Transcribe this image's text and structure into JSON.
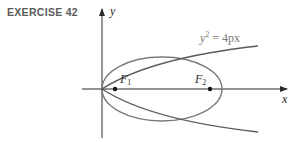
{
  "title": "EXERCISE 42",
  "axes": {
    "x_label": "x",
    "y_label": "y"
  },
  "foci": {
    "f1_label": "F",
    "f1_sub": "1",
    "f2_label": "F",
    "f2_sub": "2"
  },
  "curve_labels": {
    "parabola_lhs": "y",
    "parabola_exp": "2",
    "parabola_rhs": " = 4px"
  },
  "colors": {
    "curve": "#7a7a7a",
    "axis": "#2a2a2a",
    "title": "#5a5a5a"
  }
}
